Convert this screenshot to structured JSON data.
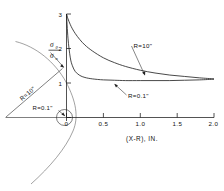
{
  "figure": {
    "name": "stress-ratio-vs-distance-plot",
    "background": "#ffffff",
    "ink_color": "#1a1a1a"
  },
  "axes": {
    "x": {
      "title": "(X-R), IN.",
      "ticks": [
        "0",
        "0.5",
        "1.0",
        "1.5",
        "2.0"
      ],
      "tick_values": [
        0,
        0.5,
        1.0,
        1.5,
        2.0
      ],
      "range": [
        0,
        2.0
      ]
    },
    "y": {
      "ticks": [
        "1",
        "2",
        "3"
      ],
      "tick_values": [
        1,
        2,
        3
      ],
      "range": [
        0,
        3
      ],
      "label_numerator": "σ",
      "label_numerator_sub": "θ",
      "label_denominator": "σ",
      "label_denominator_sub": "n"
    }
  },
  "curves": [
    {
      "name": "curve-R-10in",
      "label": "R=10\"",
      "radius_in": 10
    },
    {
      "name": "curve-R-0p1in",
      "label": "R=0.1\"",
      "radius_in": 0.1
    }
  ],
  "geometry_inset": {
    "arc_label": "R=10\"",
    "hole_label": "R=0.1\""
  },
  "chart_data": {
    "type": "line",
    "title": "",
    "xlabel": "(X-R), IN.",
    "ylabel": "σθ/σn",
    "xlim": [
      0,
      2.0
    ],
    "ylim": [
      0,
      3
    ],
    "grid": false,
    "legend": "inline-annotations",
    "x": [
      0,
      0.02,
      0.05,
      0.08,
      0.12,
      0.18,
      0.25,
      0.35,
      0.5,
      0.65,
      0.8,
      1.0,
      1.2,
      1.4,
      1.6,
      1.8,
      2.0
    ],
    "series": [
      {
        "name": "R=10\"",
        "label": "R=10\"",
        "values": [
          3.0,
          2.86,
          2.7,
          2.57,
          2.43,
          2.26,
          2.1,
          1.93,
          1.73,
          1.59,
          1.48,
          1.37,
          1.29,
          1.23,
          1.19,
          1.15,
          1.12
        ]
      },
      {
        "name": "R=0.1\"",
        "label": "R=0.1\"",
        "values": [
          3.0,
          2.3,
          1.75,
          1.5,
          1.33,
          1.22,
          1.16,
          1.12,
          1.09,
          1.08,
          1.07,
          1.07,
          1.07,
          1.07,
          1.08,
          1.09,
          1.11
        ]
      }
    ],
    "annotations": [
      {
        "text": "R=10\"",
        "x": 1.15,
        "y": 2.05
      },
      {
        "text": "R=0.1\"",
        "x": 1.0,
        "y": 0.72
      },
      {
        "text": "R=10\"",
        "note": "inset arc radius line"
      },
      {
        "text": "R=0.1\"",
        "note": "inset small hole"
      }
    ]
  }
}
